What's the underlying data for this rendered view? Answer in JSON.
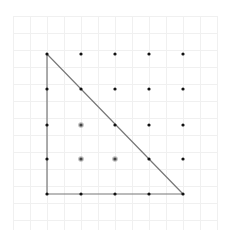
{
  "diagram": {
    "type": "geoboard-lattice",
    "background": "#ffffff",
    "grid": {
      "x0": 13,
      "y0": 16,
      "x1": 217,
      "y1": 230,
      "spacing": 17,
      "color": "#f0f0f0"
    },
    "lattice": {
      "rows": 5,
      "cols": 5,
      "x": [
        47,
        81,
        115,
        149,
        183
      ],
      "y": [
        54,
        89,
        125,
        159,
        194
      ],
      "dot_color": "#111111",
      "dot_radius": 1.6
    },
    "interior_points": [
      {
        "col": 1,
        "row": 2
      },
      {
        "col": 1,
        "row": 3
      },
      {
        "col": 2,
        "row": 3
      }
    ],
    "interior_point_color": "#444444",
    "triangle": {
      "vertices": [
        {
          "col": 0,
          "row": 0
        },
        {
          "col": 0,
          "row": 4
        },
        {
          "col": 4,
          "row": 4
        }
      ],
      "stroke": "#777777",
      "stroke_width": 1.2
    }
  }
}
